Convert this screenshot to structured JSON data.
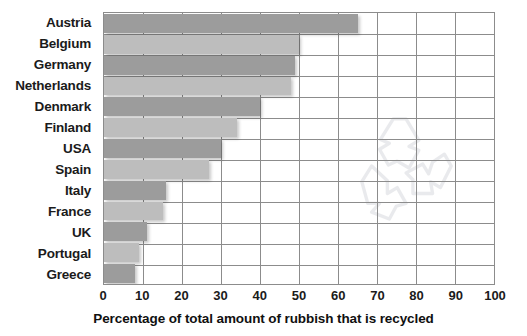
{
  "chart_data": {
    "type": "bar",
    "orientation": "horizontal",
    "title": "",
    "subtitle": "",
    "xlabel": "Percentage of total amount of rubbish that is recycled",
    "ylabel": "",
    "xlim": [
      0,
      100
    ],
    "xticks": [
      0,
      10,
      20,
      30,
      40,
      50,
      60,
      70,
      80,
      90,
      100
    ],
    "xtick_labels": [
      "0",
      "10",
      "20",
      "30",
      "40",
      "50",
      "60",
      "70",
      "80",
      "90",
      "100"
    ],
    "grid": "vertical-and-horizontal",
    "legend": "none",
    "categories": [
      "Austria",
      "Belgium",
      "Germany",
      "Netherlands",
      "Denmark",
      "Finland",
      "USA",
      "Spain",
      "Italy",
      "France",
      "UK",
      "Portugal",
      "Greece"
    ],
    "values": [
      65,
      50,
      49,
      48,
      40,
      34,
      30,
      27,
      16,
      15,
      11,
      9,
      8
    ],
    "series": [
      {
        "name": "Percentage recycled",
        "values": [
          65,
          50,
          49,
          48,
          40,
          34,
          30,
          27,
          16,
          15,
          11,
          9,
          8
        ]
      }
    ],
    "bar_colors_alternating": [
      "#9c9c9c",
      "#bdbdbd"
    ],
    "annotations": [
      "recycling-symbol-watermark"
    ]
  },
  "axis": {
    "x_title": "Percentage of total amount of rubbish that is recycled"
  },
  "colors": {
    "bar_dark": "#9c9c9c",
    "bar_light": "#bdbdbd",
    "grid": "#8c8c8c",
    "text": "#1b1b1b",
    "background": "#ffffff"
  },
  "watermark": {
    "name": "recycling-symbol"
  }
}
